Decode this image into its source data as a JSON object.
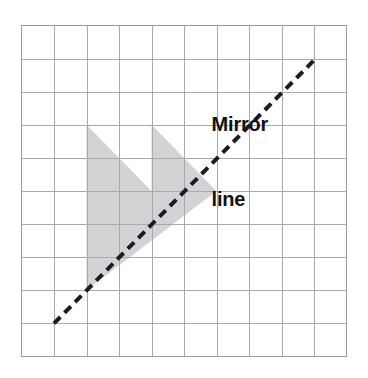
{
  "figure": {
    "background_color": "#ffffff",
    "annotations": {
      "mirror_line_label_line1": "Mirror",
      "mirror_line_label_line2": "line",
      "label_color": "#111111"
    }
  },
  "chart_data": {
    "type": "scatter",
    "xlabel": "",
    "ylabel": "",
    "grid": true,
    "grid_columns": 10,
    "grid_rows": 10,
    "xlim": [
      0,
      10
    ],
    "ylim": [
      0,
      10
    ],
    "grid_color": "#aaaaac",
    "grid_line_width": 1,
    "border_color": "#9a9a9c",
    "annotations": [
      {
        "text": "Mirror line",
        "lines": [
          "Mirror",
          "line"
        ],
        "grid_x": 5.85,
        "grid_y": 1.1,
        "color": "#111111",
        "bold": true
      }
    ],
    "series": [
      {
        "name": "mirror-line",
        "type": "line",
        "style": "dashed",
        "color": "#1a1a28",
        "line_width": 4,
        "dash_pattern": [
          9,
          6
        ],
        "points": [
          [
            1.0,
            9.0
          ],
          [
            9.1,
            0.95
          ]
        ]
      },
      {
        "name": "shaded-arrow-shape",
        "type": "polygon",
        "fill_color": "#d2d3d4",
        "stroke": "none",
        "vertices": [
          [
            2.0,
            3.0
          ],
          [
            4.0,
            5.0
          ],
          [
            4.0,
            3.0
          ],
          [
            6.0,
            5.0
          ],
          [
            2.0,
            8.0
          ]
        ]
      }
    ],
    "legend": null,
    "legend_position": "none"
  }
}
